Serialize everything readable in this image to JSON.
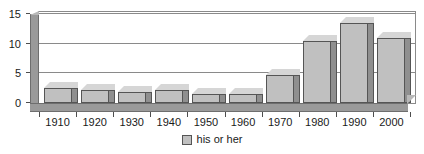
{
  "chart_data": {
    "type": "bar",
    "title": "",
    "subtitle": "",
    "xlabel": "",
    "ylabel": "",
    "categories": [
      "1910",
      "1920",
      "1930",
      "1940",
      "1950",
      "1960",
      "1970",
      "1980",
      "1990",
      "2000"
    ],
    "values": [
      2.5,
      2.2,
      1.8,
      2.2,
      1.5,
      1.5,
      4.8,
      10.5,
      13.5,
      11.0
    ],
    "series": [
      {
        "name": "his or her",
        "values": [
          2.5,
          2.2,
          1.8,
          2.2,
          1.5,
          1.5,
          4.8,
          10.5,
          13.5,
          11.0
        ]
      }
    ],
    "ylim": [
      0,
      15
    ],
    "yticks": [
      0,
      5,
      10,
      15
    ],
    "ytick_labels": [
      "0",
      "5",
      "10",
      "15"
    ],
    "grid": true,
    "grid_axis": "y",
    "legend": {
      "position": "bottom-center",
      "entries": [
        {
          "label": "his or her",
          "color": "#c0c0c0"
        }
      ]
    },
    "style": {
      "three_d": true,
      "bar_face_color": "#c0c0c0",
      "bar_side_color": "#8f8f8f",
      "bar_top_color": "#d6d6d6",
      "bar_edge_color": "#555555",
      "axis_color": "#8a8a8a",
      "wall_color": "#9a9a9a",
      "text_color": "#1a1a1a",
      "background": "#ffffff"
    }
  }
}
